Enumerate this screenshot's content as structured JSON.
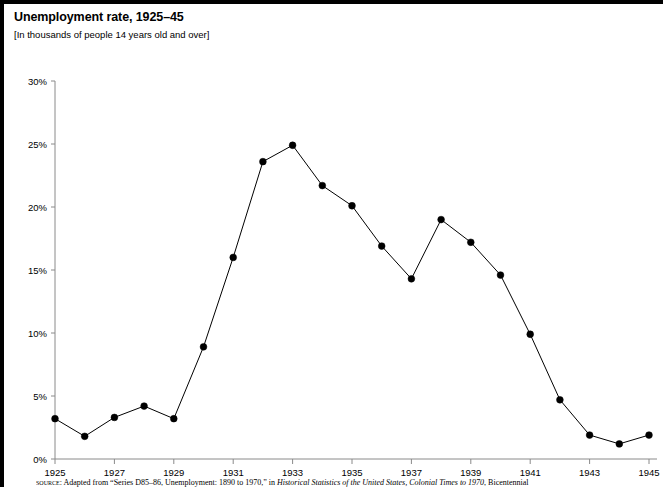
{
  "figure": {
    "title": "Unemployment rate, 1925–45",
    "subtitle": "[In thousands of people 14 years old and over]",
    "source_label": "source:",
    "source_text_1": " Adapted from “Series D85–86, Unemployment: 1890 to 1970,” in ",
    "source_italic_1": "Historical Statistics of the United States, Colonial Times to 1970",
    "source_text_2": ", Bicentennial"
  },
  "axes": {
    "y_ticks": [
      "0%",
      "5%",
      "10%",
      "15%",
      "20%",
      "25%",
      "30%"
    ],
    "x_ticks": [
      "1925",
      "1927",
      "1929",
      "1931",
      "1933",
      "1935",
      "1937",
      "1939",
      "1941",
      "1943",
      "1945"
    ]
  },
  "chart_data": {
    "type": "line",
    "title": "Unemployment rate, 1925–45",
    "subtitle": "[In thousands of people 14 years old and over]",
    "xlabel": "",
    "ylabel": "",
    "xlim": [
      1925,
      1945
    ],
    "ylim": [
      0,
      30
    ],
    "ytick_values": [
      0,
      5,
      10,
      15,
      20,
      25,
      30
    ],
    "ytick_format": "percent",
    "xtick_values": [
      1925,
      1927,
      1929,
      1931,
      1933,
      1935,
      1937,
      1939,
      1941,
      1943,
      1945
    ],
    "grid": false,
    "legend": "none",
    "marker": "filled-circle",
    "line_color": "#000000",
    "marker_color": "#000000",
    "x": [
      1925,
      1926,
      1927,
      1928,
      1929,
      1930,
      1931,
      1932,
      1933,
      1934,
      1935,
      1936,
      1937,
      1938,
      1939,
      1940,
      1941,
      1942,
      1943,
      1944,
      1945
    ],
    "values": [
      3.2,
      1.8,
      3.3,
      4.2,
      3.2,
      8.9,
      16.0,
      23.6,
      24.9,
      21.7,
      20.1,
      16.9,
      14.3,
      19.0,
      17.2,
      14.6,
      9.9,
      4.7,
      1.9,
      1.2,
      1.9
    ]
  }
}
